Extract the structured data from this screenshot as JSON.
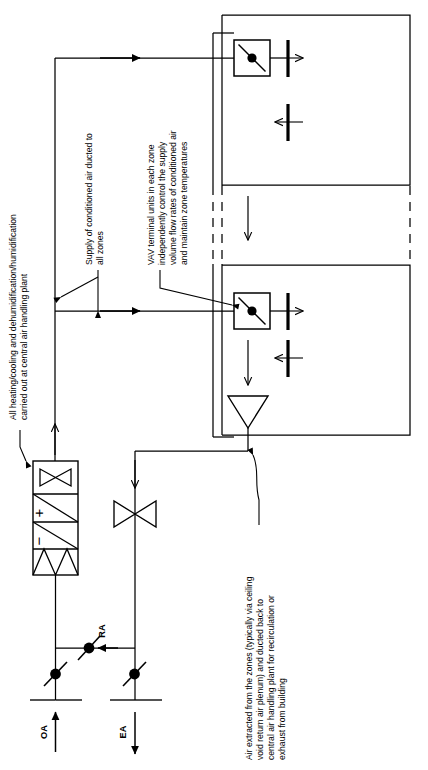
{
  "diagram": {
    "type": "hvac-schematic",
    "orientation": "rotated-90-ccw",
    "colors": {
      "line": "#000000",
      "background": "#ffffff"
    },
    "annotations": {
      "plant": {
        "id": "plant-note",
        "lines": [
          "All heating/cooling and dehumidification/humidification",
          "carried out at central air handling plant"
        ]
      },
      "supply": {
        "id": "supply-note",
        "lines": [
          "Supply of conditioned air ducted to",
          "all zones"
        ]
      },
      "vav": {
        "id": "vav-note",
        "lines": [
          "VAV terminal units in each zone",
          "independently control the supply",
          "volume flow rates of conditioned air",
          "and maintain zone temperatures"
        ]
      },
      "extract": {
        "id": "extract-note",
        "lines": [
          "Air extracted from the zones (typically via ceiling",
          "void return air plenum) and ducted back to",
          "central air handling plant for recirculation or",
          "exhaust from building"
        ]
      }
    },
    "air_labels": {
      "outside_air": "OA",
      "return_air": "RA",
      "exhaust_air": "EA"
    },
    "ahu_components": {
      "filter": "filter",
      "cooling_coil": "−",
      "heating_coil": "+",
      "supply_fan": "supply-fan"
    },
    "extract_components": {
      "extract_fan": "extract-fan"
    },
    "zones": [
      {
        "id": "zone-1",
        "vav_unit": "vav-damper",
        "supply_grille": "supply-grille",
        "return_grille": "return-grille"
      },
      {
        "id": "zone-2",
        "vav_unit": "vav-damper",
        "supply_grille": "supply-grille",
        "return_grille": "return-grille"
      }
    ],
    "dampers": [
      {
        "id": "oa-damper"
      },
      {
        "id": "ra-damper"
      },
      {
        "id": "ea-damper"
      }
    ]
  }
}
